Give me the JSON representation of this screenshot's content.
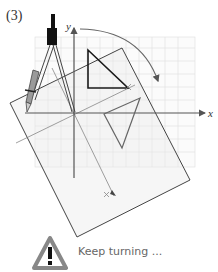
{
  "figure": {
    "step_label": "(3)",
    "axes": {
      "x_label": "x",
      "y_label": "y"
    },
    "elements": [
      "grid-paper",
      "tilted-tracing-paper",
      "compass",
      "black-triangle",
      "rotated-gray-triangle",
      "rotation-arrow",
      "construction-lines"
    ],
    "colors": {
      "grid": "#dddddd",
      "paper_fill": "#f4f4f4",
      "triangle_dark": "#222222",
      "triangle_gray": "#666666",
      "arrow": "#666666"
    }
  },
  "note": {
    "icon": "warning-icon",
    "text": "Keep turning ..."
  }
}
